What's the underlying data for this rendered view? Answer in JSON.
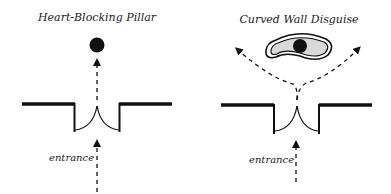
{
  "panels": [
    {
      "title": "Heart-Blocking Pillar",
      "entrance_label": "entrance",
      "elements": [
        "wall-with-double-door",
        "pillar-circle",
        "straight-dashed-arrow-path"
      ]
    },
    {
      "title": "Curved Wall Disguise",
      "entrance_label": "entrance",
      "elements": [
        "wall-with-double-door",
        "curved-capsule-wall",
        "pillar-circle",
        "split-dashed-arrow-paths"
      ]
    }
  ],
  "colors": {
    "ink": "#111111",
    "capsule_fill": "#d9d9d9",
    "background": "#ffffff"
  }
}
